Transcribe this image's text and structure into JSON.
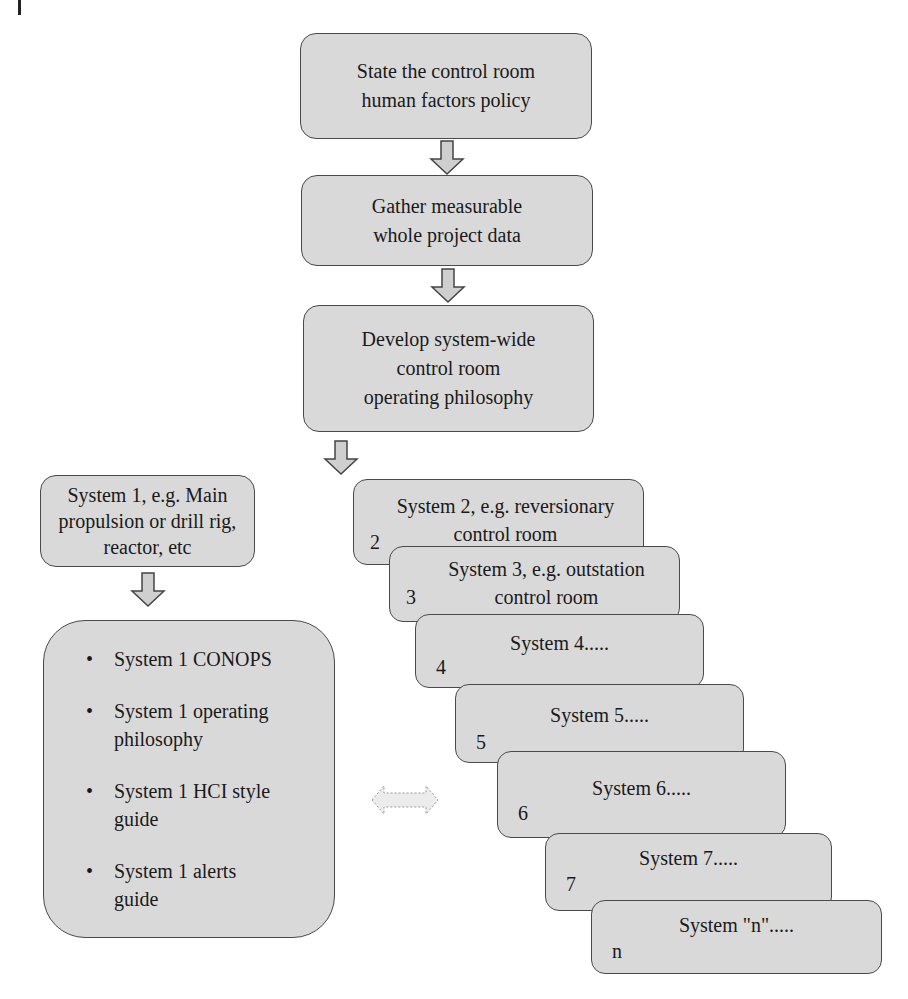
{
  "diagram": {
    "type": "flowchart",
    "main_flow": [
      {
        "id": "policy",
        "text": "State the control room\nhuman factors policy"
      },
      {
        "id": "data",
        "text": "Gather measurable\nwhole project data"
      },
      {
        "id": "philosophy",
        "text": "Develop system-wide\ncontrol room\noperating philosophy"
      }
    ],
    "system1": {
      "title": "System 1, e.g. Main\npropulsion or drill rig,\nreactor, etc",
      "bullet": "•",
      "items": [
        "System 1 CONOPS",
        "System 1 operating\nphilosophy",
        "System 1 HCI style\nguide",
        "System 1 alerts\nguide"
      ]
    },
    "systems": [
      {
        "num": "2",
        "label": "System 2, e.g. reversionary\ncontrol room"
      },
      {
        "num": "3",
        "label": "System 3, e.g. outstation\ncontrol room"
      },
      {
        "num": "4",
        "label": "System 4....."
      },
      {
        "num": "5",
        "label": "System 5....."
      },
      {
        "num": "6",
        "label": "System 6....."
      },
      {
        "num": "7",
        "label": "System 7....."
      },
      {
        "num": "n",
        "label": "System \"n\"....."
      }
    ],
    "connectors": {
      "down_arrow_icon": "arrow-down",
      "bidirectional_arrow_icon": "arrow-left-right-dashed"
    },
    "colors": {
      "box_fill": "#d9d9d9",
      "box_border": "#4a4a4a",
      "arrow_fill": "#cfcfcf",
      "dashed_arrow_fill": "#ececec"
    }
  }
}
